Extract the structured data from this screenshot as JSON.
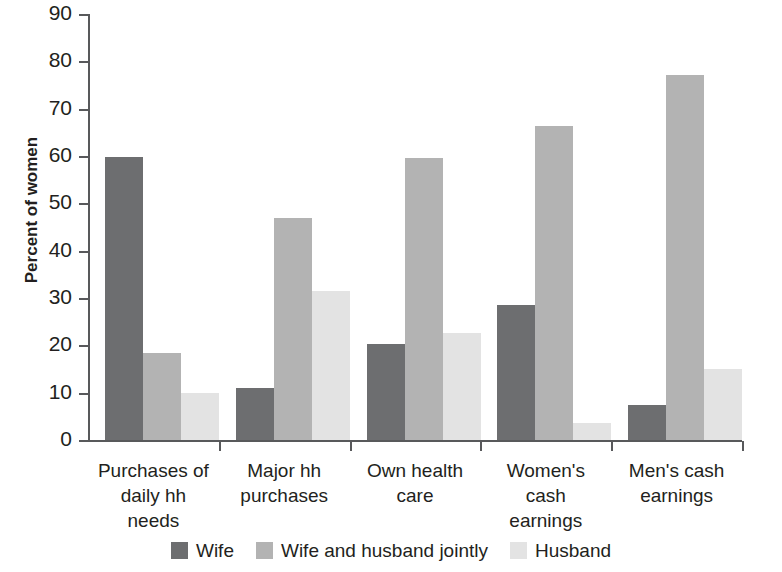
{
  "chart_data": {
    "type": "bar",
    "title": "",
    "subtitle": "",
    "xlabel": "",
    "ylabel": "Percent of women",
    "ylim": [
      0,
      90
    ],
    "ytick_step": 10,
    "yticks": [
      0,
      10,
      20,
      30,
      40,
      50,
      60,
      70,
      80,
      90
    ],
    "grid": false,
    "legend_position": "bottom",
    "categories": [
      "Purchases of daily hh needs",
      "Major hh purchases",
      "Own health care",
      "Women's cash earnings",
      "Men's cash earnings"
    ],
    "category_label_lines": [
      [
        "Purchases of",
        "daily hh",
        "needs"
      ],
      [
        "Major hh",
        "purchases"
      ],
      [
        "Own health",
        "care"
      ],
      [
        "Women's",
        "cash",
        "earnings"
      ],
      [
        "Men's cash",
        "earnings"
      ]
    ],
    "series": [
      {
        "name": "Wife",
        "color": "#6d6e70",
        "values": [
          59.8,
          10.9,
          20.3,
          28.5,
          7.5
        ]
      },
      {
        "name": "Wife and husband jointly",
        "color": "#b3b3b3",
        "values": [
          18.3,
          46.8,
          59.5,
          66.4,
          77.2
        ]
      },
      {
        "name": "Husband",
        "color": "#e3e3e3",
        "values": [
          9.9,
          31.5,
          22.7,
          3.5,
          15.0
        ]
      }
    ]
  },
  "axis": {
    "y_title": "Percent of women",
    "tick_labels": [
      "90",
      "80",
      "70",
      "60",
      "50",
      "40",
      "30",
      "20",
      "10",
      "0"
    ]
  },
  "legend": {
    "items": [
      {
        "label": "Wife",
        "color": "#6d6e70"
      },
      {
        "label": "Wife and husband jointly",
        "color": "#b3b3b3"
      },
      {
        "label": "Husband",
        "color": "#e3e3e3"
      }
    ]
  },
  "colors": {
    "axis": "#58595b",
    "text": "#231f20",
    "background": "#ffffff"
  }
}
